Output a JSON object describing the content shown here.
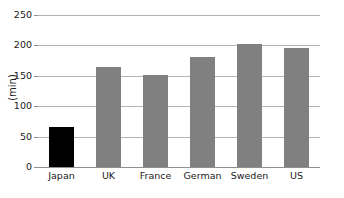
{
  "chart_data": {
    "type": "bar",
    "title": "",
    "subtitle": "",
    "xlabel": "",
    "ylabel": "(min)",
    "categories": [
      "Japan",
      "UK",
      "France",
      "German",
      "Sweden",
      "US"
    ],
    "values": [
      65,
      165,
      151,
      181,
      203,
      195
    ],
    "series": [
      {
        "name": "",
        "values": [
          65,
          165,
          151,
          181,
          203,
          195
        ]
      }
    ],
    "bar_colors": [
      "#000000",
      "#808080",
      "#808080",
      "#808080",
      "#808080",
      "#808080"
    ],
    "ylim": [
      0,
      250
    ],
    "yticks": [
      0,
      50,
      100,
      150,
      200,
      250
    ],
    "ytick_labels": [
      "0",
      "50",
      "100",
      "150",
      "200",
      "250"
    ],
    "grid": true,
    "grid_axis": "y",
    "legend": false,
    "legend_position": "none",
    "highlight_category": "Japan",
    "highlight_color": "#000000",
    "default_bar_color": "#808080",
    "grid_color": "#b4b4b4",
    "axis_color": "#909090",
    "text_color": "#1a1a1a",
    "background_color": "#ffffff"
  }
}
